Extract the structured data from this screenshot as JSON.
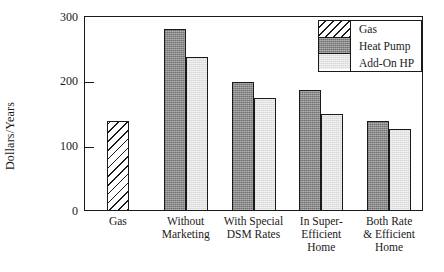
{
  "chart_data": {
    "type": "bar",
    "title": "",
    "xlabel": "",
    "ylabel": "Dollars/Years",
    "ylim": [
      0,
      320
    ],
    "yticks": [
      0,
      100,
      200,
      300
    ],
    "ytick_labels": [
      "0",
      "100",
      "200",
      "300"
    ],
    "grid": false,
    "legend_position": "top-right",
    "categories": [
      "Gas",
      "Without Marketing",
      "With Special DSM Rates",
      "In Super-Efficient Home",
      "Both Rate & Efficient Home"
    ],
    "category_lines": [
      [
        "Gas"
      ],
      [
        "Without",
        "Marketing"
      ],
      [
        "With Special",
        "DSM Rates"
      ],
      [
        "In Super-",
        "Efficient",
        "Home"
      ],
      [
        "Both Rate",
        "& Efficient",
        "Home"
      ]
    ],
    "series": [
      {
        "name": "Gas",
        "fill": "hatched-diagonal",
        "color": "#ffffff",
        "values": [
          148,
          null,
          null,
          null,
          null
        ]
      },
      {
        "name": "Heat Pump",
        "fill": "dark-gray-dither",
        "color": "#8a8a8a",
        "values": [
          null,
          298,
          212,
          198,
          148
        ]
      },
      {
        "name": "Add-On HP",
        "fill": "light-gray-dither",
        "color": "#e3e3e3",
        "values": [
          null,
          252,
          185,
          160,
          135
        ]
      }
    ]
  },
  "legend": {
    "entries": [
      {
        "label": "Gas"
      },
      {
        "label": "Heat Pump"
      },
      {
        "label": "Add-On HP"
      }
    ]
  },
  "axis": {
    "y_title": "Dollars/Years",
    "y_tick_0": "0",
    "y_tick_1": "100",
    "y_tick_2": "200",
    "y_tick_3": "300"
  }
}
